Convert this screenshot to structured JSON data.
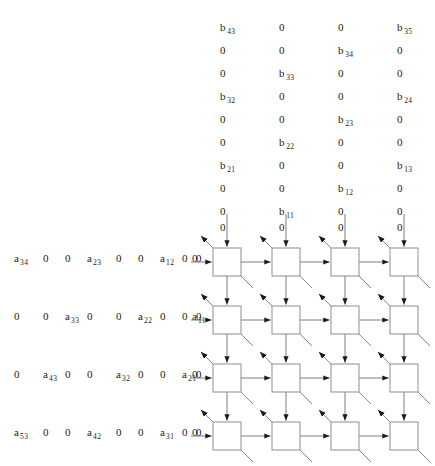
{
  "figure": {
    "type": "systolic-array-diagram",
    "title": "",
    "grid": {
      "rows": 4,
      "cols": 4,
      "cell_label": ""
    }
  },
  "b_stream": {
    "description": "Matrix B operand skewed input stream entering the top of each column",
    "columns": 4,
    "rows": [
      [
        "b_43",
        "0",
        "0",
        "b_35"
      ],
      [
        "0",
        "0",
        "b_34",
        "0"
      ],
      [
        "0",
        "b_33",
        "0",
        "0"
      ],
      [
        "b_32",
        "0",
        "0",
        "b_24"
      ],
      [
        "0",
        "0",
        "b_23",
        "0"
      ],
      [
        "0",
        "b_22",
        "0",
        "0"
      ],
      [
        "b_21",
        "0",
        "0",
        "b_13"
      ],
      [
        "0",
        "0",
        "b_12",
        "0"
      ],
      [
        "0",
        "b_11",
        "0",
        "0"
      ],
      [
        "0",
        "0",
        "0",
        "0"
      ]
    ]
  },
  "a_stream": {
    "description": "Matrix A operand skewed input stream entering the left of each row",
    "rows": [
      [
        "a_34",
        "0",
        "0",
        "a_23",
        "0",
        "0",
        "a_12",
        "0",
        "0",
        "0"
      ],
      [
        "0",
        "0",
        "a_33",
        "0",
        "0",
        "a_22",
        "0",
        "0",
        "a_11",
        "0"
      ],
      [
        "0",
        "a_43",
        "0",
        "0",
        "a_32",
        "0",
        "0",
        "a_21",
        "0",
        "0"
      ],
      [
        "a_53",
        "0",
        "0",
        "a_42",
        "0",
        "0",
        "a_31",
        "0",
        "0",
        "0"
      ]
    ]
  },
  "tokens": {
    "zero": "0",
    "a_34": {
      "base": "a",
      "sub": "34"
    },
    "a_23": {
      "base": "a",
      "sub": "23"
    },
    "a_12": {
      "base": "a",
      "sub": "12"
    },
    "a_33": {
      "base": "a",
      "sub": "33"
    },
    "a_22": {
      "base": "a",
      "sub": "22"
    },
    "a_11": {
      "base": "a",
      "sub": "11"
    },
    "a_43": {
      "base": "a",
      "sub": "43"
    },
    "a_32": {
      "base": "a",
      "sub": "32"
    },
    "a_21": {
      "base": "a",
      "sub": "21"
    },
    "a_53": {
      "base": "a",
      "sub": "53"
    },
    "a_42": {
      "base": "a",
      "sub": "42"
    },
    "a_31": {
      "base": "a",
      "sub": "31"
    },
    "b_43": {
      "base": "b",
      "sub": "43"
    },
    "b_35": {
      "base": "b",
      "sub": "35"
    },
    "b_34": {
      "base": "b",
      "sub": "34"
    },
    "b_33": {
      "base": "b",
      "sub": "33"
    },
    "b_32": {
      "base": "b",
      "sub": "32"
    },
    "b_24": {
      "base": "b",
      "sub": "24"
    },
    "b_23": {
      "base": "b",
      "sub": "23"
    },
    "b_22": {
      "base": "b",
      "sub": "22"
    },
    "b_21": {
      "base": "b",
      "sub": "21"
    },
    "b_13": {
      "base": "b",
      "sub": "13"
    },
    "b_12": {
      "base": "b",
      "sub": "12"
    },
    "b_11": {
      "base": "b",
      "sub": "11"
    }
  },
  "layout": {
    "b_col_x": [
      226,
      285,
      344,
      403
    ],
    "b_row_y": [
      22,
      45,
      68,
      91,
      114,
      137,
      160,
      183,
      206,
      222
    ],
    "cell_x": [
      213,
      272,
      331,
      390
    ],
    "cell_y": [
      248,
      306,
      364,
      422
    ],
    "cell_size": 28,
    "a_row_y": [
      258,
      316,
      374,
      432
    ],
    "a_tok_x": [
      14,
      43,
      65,
      87,
      116,
      138,
      160,
      182,
      192,
      196
    ]
  },
  "colors": {
    "background": "#ffffff",
    "ink": "#1a1a1a",
    "wire": "#6f6f6f",
    "box_stroke": "#8d8d8d"
  }
}
